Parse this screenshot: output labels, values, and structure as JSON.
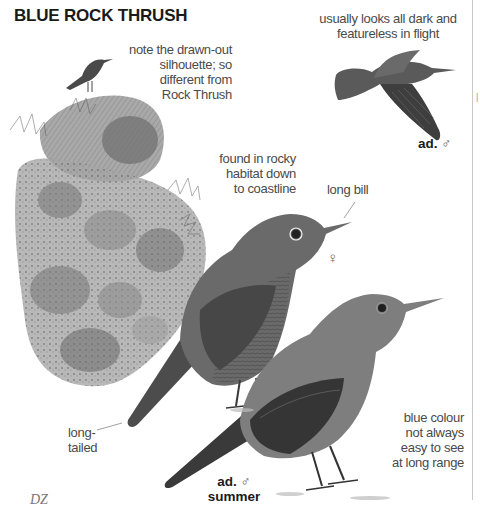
{
  "page": {
    "title": "BLUE ROCK THRUSH",
    "credit": "DZ"
  },
  "annotations": {
    "silhouette_note": [
      "note the drawn-out",
      "silhouette; so",
      "different from",
      "Rock Thrush"
    ],
    "flight_note": [
      "usually looks all dark and",
      "featureless in flight"
    ],
    "habitat_note": [
      "found in rocky",
      "habitat down",
      "to coastline"
    ],
    "bill_note": "long bill",
    "tail_note": [
      "long-",
      "tailed"
    ],
    "colour_note": [
      "blue colour",
      "not always",
      "easy to see",
      "at long range"
    ]
  },
  "plumage_labels": {
    "flight_bird": {
      "age": "ad.",
      "sex_symbol": "♂"
    },
    "female": {
      "sex_symbol": "♀"
    },
    "summer_male": {
      "age": "ad.",
      "sex_symbol": "♂",
      "season": "summer"
    }
  },
  "colors": {
    "text": "#4a4a4a",
    "title": "#1a1a1a",
    "bird_dark": "#3a3a3a",
    "bird_mid": "#6e6e6e",
    "rock": "#8a8a8a"
  }
}
